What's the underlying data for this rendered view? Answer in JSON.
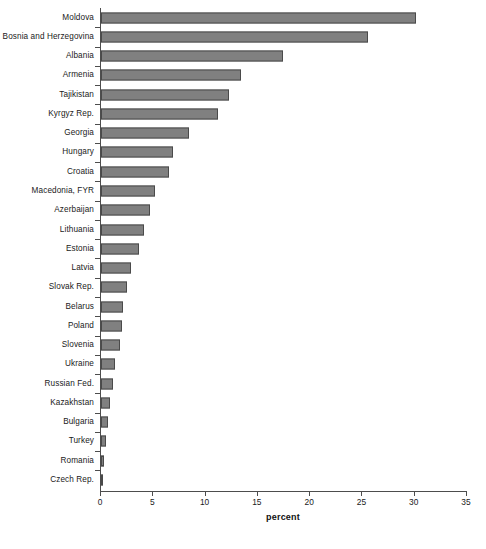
{
  "chart_data": {
    "type": "bar",
    "orientation": "horizontal",
    "title": "",
    "xlabel": "percent",
    "ylabel": "",
    "xlim": [
      0,
      35
    ],
    "xticks": [
      0,
      5,
      10,
      15,
      20,
      25,
      30,
      35
    ],
    "grid": false,
    "legend": null,
    "bar_color": "#808080",
    "bar_border_color": "#4a4a4a",
    "axis_color": "#4d4d4d",
    "categories": [
      "Moldova",
      "Bosnia and Herzegovina",
      "Albania",
      "Armenia",
      "Tajikistan",
      "Kyrgyz Rep.",
      "Georgia",
      "Hungary",
      "Croatia",
      "Macedonia, FYR",
      "Azerbaijan",
      "Lithuania",
      "Estonia",
      "Latvia",
      "Slovak Rep.",
      "Belarus",
      "Poland",
      "Slovenia",
      "Ukraine",
      "Russian Fed.",
      "Kazakhstan",
      "Bulgaria",
      "Turkey",
      "Romania",
      "Czech Rep."
    ],
    "values": [
      30.1,
      25.5,
      17.4,
      13.4,
      12.2,
      11.2,
      8.4,
      6.9,
      6.5,
      5.2,
      4.7,
      4.1,
      3.6,
      2.9,
      2.5,
      2.1,
      2.0,
      1.8,
      1.3,
      1.1,
      0.9,
      0.7,
      0.5,
      0.3,
      0.2
    ]
  },
  "footnote": ""
}
